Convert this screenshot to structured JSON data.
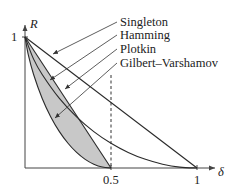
{
  "chart_data": {
    "type": "line",
    "title": "",
    "xlabel": "δ",
    "ylabel": "R",
    "xlim": [
      0,
      1
    ],
    "ylim": [
      0,
      1
    ],
    "x_ticks": [
      {
        "value": 0.5,
        "label": "0.5"
      },
      {
        "value": 1,
        "label": "1"
      }
    ],
    "y_ticks": [
      {
        "value": 1,
        "label": "1"
      }
    ],
    "grid": false,
    "legend_position": "top-right (leader-line labels)",
    "annotations": [
      "dashed vertical line at δ = 0.5",
      "shaded region between Gilbert–Varshamov and Plotkin bounds"
    ],
    "series": [
      {
        "name": "Singleton",
        "formula": "R = 1 − δ",
        "x": [
          0,
          1
        ],
        "y": [
          1,
          0
        ]
      },
      {
        "name": "Hamming",
        "formula": "R = 1 − H(δ/2)",
        "x": [
          0,
          0.05,
          0.1,
          0.2,
          0.3,
          0.4,
          0.5,
          0.6,
          0.7,
          0.8,
          0.9,
          1.0
        ],
        "y": [
          1,
          0.831,
          0.714,
          0.531,
          0.39,
          0.278,
          0.189,
          0.119,
          0.066,
          0.029,
          0.007,
          0
        ]
      },
      {
        "name": "Plotkin",
        "formula": "R = 1 − 2δ",
        "x": [
          0,
          0.5
        ],
        "y": [
          1,
          0
        ]
      },
      {
        "name": "Gilbert–Varshamov",
        "formula": "R = 1 − H(δ)",
        "x": [
          0,
          0.02,
          0.05,
          0.1,
          0.15,
          0.2,
          0.25,
          0.3,
          0.35,
          0.4,
          0.45,
          0.5
        ],
        "y": [
          1,
          0.859,
          0.714,
          0.531,
          0.39,
          0.278,
          0.189,
          0.119,
          0.066,
          0.029,
          0.007,
          0
        ]
      }
    ]
  },
  "labels": {
    "y_axis": "R",
    "x_axis": "δ",
    "y_tick_1": "1",
    "x_tick_half": "0.5",
    "x_tick_1": "1",
    "legend": [
      "Singleton",
      "Hamming",
      "Plotkin",
      "Gilbert–Varshamov"
    ]
  },
  "colors": {
    "line": "#2a2a2a",
    "shade": "#c8c8c8",
    "background": "#ffffff"
  }
}
